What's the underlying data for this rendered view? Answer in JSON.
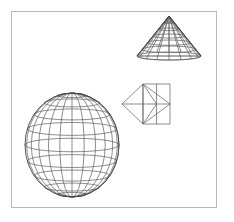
{
  "scene": {
    "title": "3D wireframe primitives",
    "background_color": "#ffffff",
    "frame": {
      "name": "canvas-border",
      "color": "#b8b8b8",
      "x": 11,
      "y": 11,
      "width": 206,
      "height": 197,
      "stroke_width": 1
    },
    "wire_color": "#5c5c5c",
    "wire_color_dark": "#3a3a3a",
    "objects": [
      {
        "id": "cone",
        "label": "Cone",
        "shape": "cone-wireframe",
        "apex_x": 169,
        "apex_y": 16,
        "base_center_x": 169,
        "base_center_y": 56,
        "base_half_width": 32,
        "base_half_height": 4,
        "latitude_rings": 6,
        "meridians": 9
      },
      {
        "id": "box",
        "label": "Box",
        "shape": "box-wireframe",
        "front_left": 143,
        "front_top": 84,
        "front_width": 27,
        "front_height": 40,
        "side_tip_x": 122,
        "side_tip_y": 104,
        "diagonals": 4
      },
      {
        "id": "sphere",
        "label": "Sphere",
        "shape": "sphere-wireframe",
        "center_x": 72,
        "center_y": 145,
        "radius_x": 47,
        "radius_y": 52,
        "latitude_lines": 9,
        "meridian_lines": 12
      }
    ]
  }
}
